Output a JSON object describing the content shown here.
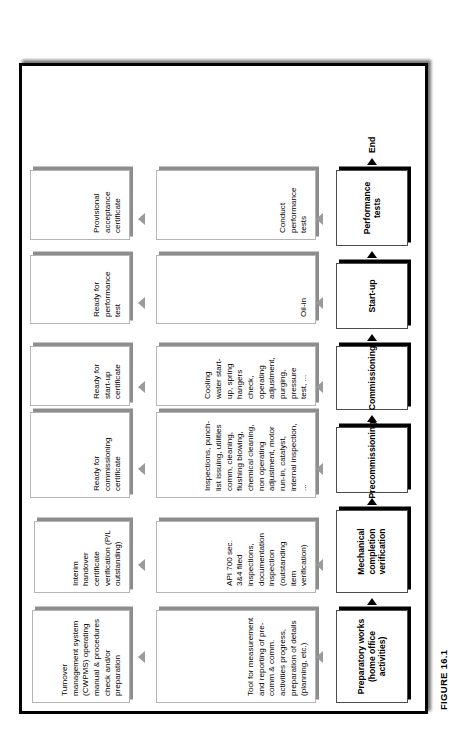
{
  "figure": {
    "caption": "FIGURE 16.1",
    "end_label": "End"
  },
  "flow": {
    "phases": [
      {
        "label": "Preparatory works (home office activities)",
        "detail": "Tool for measurement and reporting of pre-comm & comm. activities progress, preparation of details (planning, etc.)",
        "output": "Turnover management system (CWPMS) operating manual & procedures check and/or preparation"
      },
      {
        "label": "Mechanical completion verification",
        "detail": "API 700 sec. 3&4 filed inspections, documentation inspection (outstanding item verification)",
        "output": "Interim handover certificate verification (P/L outstanding)"
      },
      {
        "label": "Precommissioning",
        "detail": "Inspections, punch-list issuing, utilities comm, cleaning, flushing blowing, chemical cleaning, non operating adjustment, motor run-in, catalyst, internal inspection, ...",
        "output": "Ready for commissioning certificate"
      },
      {
        "label": "Commissioning",
        "detail": "Cooling water start-up, spring hangers check, operating adjustment, purging, pressure test, ...",
        "output": "Ready for start-up certificate"
      },
      {
        "label": "Start-up",
        "detail": "Oil-in",
        "output": "Ready for performance test"
      },
      {
        "label": "Performance tests",
        "detail": "Conduct performance tests",
        "output": "Provisional acceptance certificate"
      }
    ]
  },
  "colors": {
    "frame": "#000000",
    "phase_border": "#4d4d4d",
    "box_border": "#b5b5b5",
    "box_shadow": "#8d8d8d",
    "arrow_up": "#9a9a9a",
    "arrow_right": "#000000"
  }
}
